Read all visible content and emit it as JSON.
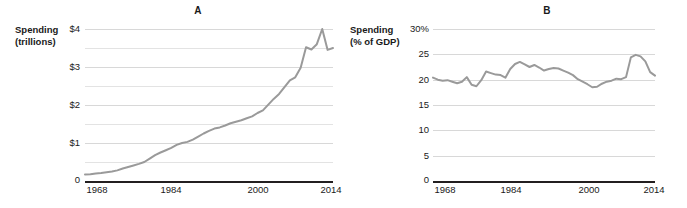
{
  "figure": {
    "background": "#ffffff",
    "line_color": "#9a9a9a",
    "gridline_color": "#e3e3e3",
    "axis_color": "#231f20"
  },
  "panels": [
    {
      "label": "A",
      "axis_title_line1": "Spending",
      "axis_title_line2": "(trillions)",
      "yticks": [
        "$4",
        "$3",
        "$2",
        "$1",
        "0"
      ],
      "xticks": [
        "1968",
        "1984",
        "2000",
        "2014"
      ]
    },
    {
      "label": "B",
      "axis_title_line1": "Spending",
      "axis_title_line2": "(% of GDP)",
      "yticks": [
        "30%",
        "25",
        "20",
        "15",
        "10",
        "5",
        "0"
      ],
      "xticks": [
        "1968",
        "1984",
        "2000",
        "2014"
      ]
    }
  ],
  "chart_data": [
    {
      "type": "line",
      "title": "A",
      "xlabel": "",
      "ylabel": "Spending (trillions)",
      "xlim": [
        1968,
        2014
      ],
      "ylim": [
        0,
        4
      ],
      "xticks": [
        1968,
        1984,
        2000,
        2014
      ],
      "yticks": [
        0,
        1,
        2,
        3,
        4
      ],
      "ytick_labels": [
        "0",
        "$1",
        "$2",
        "$3",
        "$4"
      ],
      "grid": true,
      "gridline_values": [
        0.5,
        1.0,
        1.5,
        2.0,
        2.5,
        3.0,
        3.5,
        4.0
      ],
      "legend": "none",
      "units": "trillions of dollars",
      "x": [
        1968,
        1969,
        1970,
        1971,
        1972,
        1973,
        1974,
        1975,
        1976,
        1977,
        1978,
        1979,
        1980,
        1981,
        1982,
        1983,
        1984,
        1985,
        1986,
        1987,
        1988,
        1989,
        1990,
        1991,
        1992,
        1993,
        1994,
        1995,
        1996,
        1997,
        1998,
        1999,
        2000,
        2001,
        2002,
        2003,
        2004,
        2005,
        2006,
        2007,
        2008,
        2009,
        2010,
        2011,
        2012,
        2013,
        2014
      ],
      "values": [
        0.17,
        0.18,
        0.2,
        0.21,
        0.23,
        0.25,
        0.28,
        0.33,
        0.37,
        0.41,
        0.45,
        0.5,
        0.59,
        0.68,
        0.75,
        0.81,
        0.87,
        0.95,
        1.0,
        1.03,
        1.09,
        1.17,
        1.25,
        1.32,
        1.38,
        1.41,
        1.46,
        1.52,
        1.56,
        1.6,
        1.65,
        1.7,
        1.79,
        1.86,
        2.01,
        2.16,
        2.29,
        2.47,
        2.65,
        2.73,
        2.98,
        3.52,
        3.46,
        3.6,
        4.0,
        3.45,
        3.5
      ]
    },
    {
      "type": "line",
      "title": "B",
      "xlabel": "",
      "ylabel": "Spending (% of GDP)",
      "xlim": [
        1968,
        2014
      ],
      "ylim": [
        0,
        30
      ],
      "xticks": [
        1968,
        1984,
        2000,
        2014
      ],
      "yticks": [
        0,
        5,
        10,
        15,
        20,
        25,
        30
      ],
      "ytick_labels": [
        "0",
        "5",
        "10",
        "15",
        "20",
        "25",
        "30%"
      ],
      "grid": true,
      "legend": "none",
      "units": "percent of GDP",
      "x": [
        1968,
        1969,
        1970,
        1971,
        1972,
        1973,
        1974,
        1975,
        1976,
        1977,
        1978,
        1979,
        1980,
        1981,
        1982,
        1983,
        1984,
        1985,
        1986,
        1987,
        1988,
        1989,
        1990,
        1991,
        1992,
        1993,
        1994,
        1995,
        1996,
        1997,
        1998,
        1999,
        2000,
        2001,
        2002,
        2003,
        2004,
        2005,
        2006,
        2007,
        2008,
        2009,
        2010,
        2011,
        2012,
        2013,
        2014
      ],
      "values": [
        20.4,
        20.0,
        19.8,
        19.9,
        19.6,
        19.3,
        19.6,
        20.5,
        19.0,
        18.7,
        19.9,
        21.6,
        21.3,
        21.0,
        20.9,
        20.4,
        22.1,
        23.1,
        23.5,
        23.0,
        22.5,
        22.9,
        22.4,
        21.8,
        22.1,
        22.3,
        22.2,
        21.8,
        21.4,
        20.9,
        20.1,
        19.6,
        19.1,
        18.5,
        18.6,
        19.2,
        19.6,
        19.8,
        20.2,
        20.1,
        20.5,
        24.4,
        24.9,
        24.6,
        23.6,
        21.5,
        20.8
      ]
    }
  ]
}
